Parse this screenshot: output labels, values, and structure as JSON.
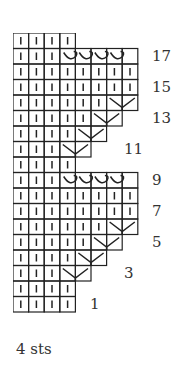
{
  "chart": {
    "rows": [
      {
        "n": 19,
        "cells": "kkkk"
      },
      {
        "n": 18,
        "cells": "kkkc",
        "cable": [
          3,
          8
        ]
      },
      {
        "n": 17,
        "cells": "kkkkkkkk"
      },
      {
        "n": 16,
        "cells": "kkkkkkkk"
      },
      {
        "n": 15,
        "cells": "kkkkkkv",
        "dec": 6
      },
      {
        "n": 14,
        "cells": "kkkkkv",
        "dec": 5
      },
      {
        "n": 13,
        "cells": "kkkkv",
        "dec": 4
      },
      {
        "n": 12,
        "cells": "kkkv",
        "dec": 3
      },
      {
        "n": 11,
        "cells": "kkkk"
      },
      {
        "n": 10,
        "cells": "kkkc",
        "cable": [
          3,
          8
        ]
      },
      {
        "n": 9,
        "cells": "kkkkkkkk"
      },
      {
        "n": 8,
        "cells": "kkkkkkkk"
      },
      {
        "n": 7,
        "cells": "kkkkkkv",
        "dec": 6
      },
      {
        "n": 6,
        "cells": "kkkkkv",
        "dec": 5
      },
      {
        "n": 5,
        "cells": "kkkkv",
        "dec": 4
      },
      {
        "n": 4,
        "cells": "kkkv",
        "dec": 3
      },
      {
        "n": 3,
        "cells": "kkkk"
      },
      {
        "n": 2,
        "cells": "kkkk"
      }
    ],
    "row_labels": [
      {
        "text": "17",
        "row": 1,
        "x": 152
      },
      {
        "text": "15",
        "row": 3,
        "x": 152
      },
      {
        "text": "13",
        "row": 5,
        "x": 152
      },
      {
        "text": "11",
        "row": 7,
        "x": 124
      },
      {
        "text": "9",
        "row": 9,
        "x": 152
      },
      {
        "text": "7",
        "row": 11,
        "x": 152
      },
      {
        "text": "5",
        "row": 13,
        "x": 152
      },
      {
        "text": "3",
        "row": 15,
        "x": 124
      },
      {
        "text": "1",
        "row": 17,
        "x": 90
      }
    ],
    "footer": "4 sts"
  }
}
